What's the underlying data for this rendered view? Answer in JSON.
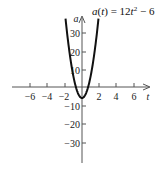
{
  "chart_data": {
    "type": "line",
    "function": "12*t^2 - 6",
    "xlabel": "t",
    "ylabel": "a",
    "xlim": [
      -7.8,
      7.8
    ],
    "ylim": [
      -40,
      39
    ],
    "x_ticks": [
      -6,
      -4,
      -2,
      2,
      4,
      6
    ],
    "x_tick_labels": [
      "−6",
      "−4",
      "−2",
      "2",
      "4",
      "6"
    ],
    "y_ticks": [
      30,
      20,
      10,
      -10,
      -20,
      -30
    ],
    "y_tick_labels": [
      "30",
      "20",
      "10",
      "−10",
      "−20",
      "−30"
    ],
    "grid": false,
    "legend": "none",
    "series": [
      {
        "name": "a(t) = 12t² − 6",
        "x": [
          -1.86,
          -1.5,
          -1.0,
          -0.5,
          0,
          0.5,
          1.0,
          1.5,
          1.86
        ],
        "y": [
          35.5,
          21,
          6,
          -3,
          -6,
          -3,
          6,
          21,
          35.5
        ]
      }
    ],
    "vertex": {
      "t": 0,
      "a": -6
    }
  },
  "labels": {
    "title_prefix": "a(t) = 12t",
    "title_exp": "2",
    "title_suffix": " − 6",
    "x_axis": "t",
    "y_axis": "a"
  },
  "colors": {
    "curve": "#111111",
    "axis": "#555555",
    "text": "#222222"
  }
}
